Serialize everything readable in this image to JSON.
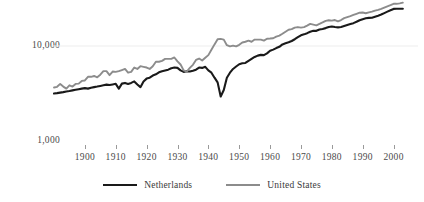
{
  "chart_data": {
    "type": "line",
    "title": "",
    "subtitle": "",
    "xlabel": "",
    "ylabel": "",
    "scale": "log",
    "grid": true,
    "legend_position": "bottom",
    "x_ticks": [
      1900,
      1910,
      1920,
      1930,
      1940,
      1950,
      1960,
      1970,
      1980,
      1990,
      2000
    ],
    "x_tick_labels": [
      "1900",
      "1910",
      "1920",
      "1930",
      "1940",
      "1950",
      "1960",
      "1970",
      "1980",
      "1990",
      "2000"
    ],
    "xlim": [
      1890,
      2005
    ],
    "y_ticks": [
      1000,
      10000
    ],
    "y_tick_labels": [
      "1,000",
      "10,000"
    ],
    "ylim": [
      1000,
      40000
    ],
    "gridline_values": [
      10000
    ],
    "colors": {
      "netherlands": "#1a1a1a",
      "united_states": "#8c8c8c",
      "gridline": "#ededed",
      "tick": "#9a9a9a",
      "text": "#3a3a3a",
      "background": "#ffffff"
    },
    "series": [
      {
        "name": "Netherlands",
        "color": "#1a1a1a",
        "x": [
          1890,
          1891,
          1892,
          1893,
          1894,
          1895,
          1896,
          1897,
          1898,
          1899,
          1900,
          1901,
          1902,
          1903,
          1904,
          1905,
          1906,
          1907,
          1908,
          1909,
          1910,
          1911,
          1912,
          1913,
          1914,
          1915,
          1916,
          1917,
          1918,
          1919,
          1920,
          1921,
          1922,
          1923,
          1924,
          1925,
          1926,
          1927,
          1928,
          1929,
          1930,
          1931,
          1932,
          1933,
          1934,
          1935,
          1936,
          1937,
          1938,
          1939,
          1940,
          1941,
          1942,
          1943,
          1944,
          1945,
          1946,
          1947,
          1948,
          1949,
          1950,
          1951,
          1952,
          1953,
          1954,
          1955,
          1956,
          1957,
          1958,
          1959,
          1960,
          1961,
          1962,
          1963,
          1964,
          1965,
          1966,
          1967,
          1968,
          1969,
          1970,
          1971,
          1972,
          1973,
          1974,
          1975,
          1976,
          1977,
          1978,
          1979,
          1980,
          1981,
          1982,
          1983,
          1984,
          1985,
          1986,
          1987,
          1988,
          1989,
          1990,
          1991,
          1992,
          1993,
          1994,
          1995,
          1996,
          1997,
          1998,
          1999,
          2000,
          2001,
          2002,
          2003
        ],
        "y": [
          3120,
          3150,
          3190,
          3230,
          3280,
          3320,
          3370,
          3420,
          3470,
          3520,
          3560,
          3520,
          3600,
          3650,
          3700,
          3760,
          3820,
          3880,
          3840,
          3900,
          3960,
          3520,
          3980,
          4050,
          3950,
          4050,
          4200,
          3900,
          3650,
          4200,
          4500,
          4600,
          4850,
          5000,
          5250,
          5400,
          5500,
          5600,
          5800,
          5900,
          5850,
          5500,
          5300,
          5400,
          5350,
          5450,
          5600,
          5900,
          5850,
          6000,
          5500,
          5200,
          4600,
          4100,
          2900,
          3400,
          4600,
          5200,
          5700,
          6050,
          6400,
          6550,
          6600,
          6950,
          7300,
          7650,
          7900,
          8050,
          8000,
          8350,
          8900,
          9150,
          9500,
          9800,
          10400,
          10700,
          10950,
          11300,
          11800,
          12400,
          13000,
          13300,
          13700,
          14200,
          14500,
          14500,
          15000,
          15200,
          15500,
          15900,
          16100,
          15900,
          15800,
          15900,
          16300,
          16700,
          17100,
          17500,
          18100,
          18800,
          19300,
          19700,
          19900,
          20000,
          20500,
          21000,
          21600,
          22400,
          23200,
          24000,
          24800,
          24900,
          24900,
          24900
        ]
      },
      {
        "name": "United States",
        "color": "#8c8c8c",
        "x": [
          1890,
          1891,
          1892,
          1893,
          1894,
          1895,
          1896,
          1897,
          1898,
          1899,
          1900,
          1901,
          1902,
          1903,
          1904,
          1905,
          1906,
          1907,
          1908,
          1909,
          1910,
          1911,
          1912,
          1913,
          1914,
          1915,
          1916,
          1917,
          1918,
          1919,
          1920,
          1921,
          1922,
          1923,
          1924,
          1925,
          1926,
          1927,
          1928,
          1929,
          1930,
          1931,
          1932,
          1933,
          1934,
          1935,
          1936,
          1937,
          1938,
          1939,
          1940,
          1941,
          1942,
          1943,
          1944,
          1945,
          1946,
          1947,
          1948,
          1949,
          1950,
          1951,
          1952,
          1953,
          1954,
          1955,
          1956,
          1957,
          1958,
          1959,
          1960,
          1961,
          1962,
          1963,
          1964,
          1965,
          1966,
          1967,
          1968,
          1969,
          1970,
          1971,
          1972,
          1973,
          1974,
          1975,
          1976,
          1977,
          1978,
          1979,
          1980,
          1981,
          1982,
          1983,
          1984,
          1985,
          1986,
          1987,
          1988,
          1989,
          1990,
          1991,
          1992,
          1993,
          1994,
          1995,
          1996,
          1997,
          1998,
          1999,
          2000,
          2001,
          2002,
          2003
        ],
        "y": [
          3620,
          3680,
          3950,
          3700,
          3520,
          3820,
          3700,
          3950,
          3980,
          4250,
          4300,
          4700,
          4700,
          4800,
          4650,
          4950,
          5400,
          5400,
          4900,
          5350,
          5300,
          5400,
          5550,
          5700,
          5200,
          5300,
          5900,
          5700,
          6100,
          6000,
          5900,
          5700,
          6100,
          6800,
          6800,
          6950,
          7300,
          7300,
          7300,
          7550,
          6850,
          6350,
          5500,
          5350,
          5850,
          6300,
          7100,
          7350,
          7000,
          7500,
          8000,
          9100,
          10400,
          11800,
          11900,
          11700,
          10200,
          9900,
          10100,
          9900,
          10300,
          10900,
          11100,
          11400,
          11100,
          11700,
          11700,
          11700,
          11400,
          11950,
          12000,
          12100,
          12600,
          12900,
          13500,
          14200,
          14900,
          15100,
          15700,
          15900,
          15700,
          15900,
          16500,
          17200,
          16900,
          16600,
          17200,
          17800,
          18500,
          18800,
          18600,
          18900,
          18300,
          18900,
          19800,
          20300,
          20800,
          21400,
          22000,
          22600,
          22700,
          22300,
          22800,
          23200,
          23800,
          24200,
          24800,
          25600,
          26400,
          27200,
          28100,
          28100,
          28400,
          28900
        ]
      }
    ]
  },
  "axis": {
    "y_labels": [
      {
        "text": "10,000"
      },
      {
        "text": "1,000"
      }
    ],
    "x_labels": [
      {
        "text": "1900"
      },
      {
        "text": "1910"
      },
      {
        "text": "1920"
      },
      {
        "text": "1930"
      },
      {
        "text": "1940"
      },
      {
        "text": "1950"
      },
      {
        "text": "1960"
      },
      {
        "text": "1970"
      },
      {
        "text": "1980"
      },
      {
        "text": "1990"
      },
      {
        "text": "2000"
      }
    ]
  },
  "legend": {
    "entries": [
      {
        "label": "Netherlands",
        "color": "#1a1a1a"
      },
      {
        "label": "United States",
        "color": "#8c8c8c"
      }
    ]
  }
}
